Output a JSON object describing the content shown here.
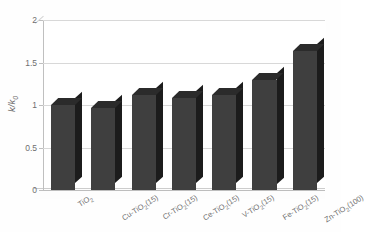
{
  "chart_data": {
    "type": "bar",
    "title": "",
    "subtitle": "",
    "xlabel": "",
    "ylabel": "k/k₀",
    "ylim": [
      0,
      2
    ],
    "ytick_values": [
      2,
      1.5,
      1,
      0.5,
      0
    ],
    "ytick_labels": [
      "2",
      "1.5",
      "1",
      "0.5",
      "0"
    ],
    "grid": true,
    "legend": false,
    "legend_position": "none",
    "style": "3d-column",
    "bar_color": "#3f3f3f",
    "bar_side_color": "#1c1c1c",
    "bar_top_color": "#2b2b2b",
    "grid_color": "#d8d8d8",
    "axis_color": "#bfbfbf",
    "text_color": "#6e6e6e",
    "background": "#ffffff",
    "categories": [
      "TiO₂",
      "Cu-TiO₂(15)",
      "Cr-TiO₂(15)",
      "Ce-TiO₂(15)",
      "V-TiO₂(15)",
      "Fe-TiO₂(15)",
      "Zn-TiO₂(100)"
    ],
    "categories_html": [
      "TiO<sub>2</sub>",
      "Cu-TiO<sub>2</sub>(15)",
      "Cr-TiO<sub>2</sub>(15)",
      "Ce-TiO<sub>2</sub>(15)",
      "V-TiO<sub>2</sub>(15)",
      "Fe-TiO<sub>2</sub>(15)",
      "Zn-TiO<sub>2</sub>(100)"
    ],
    "values": [
      1.0,
      0.97,
      1.12,
      1.08,
      1.12,
      1.3,
      1.63
    ],
    "series": [
      {
        "name": "k/k₀",
        "values": [
          1.0,
          0.97,
          1.12,
          1.08,
          1.12,
          1.3,
          1.63
        ]
      }
    ]
  },
  "axis": {
    "y_title_main": "k/k",
    "y_title_sub": "0"
  }
}
